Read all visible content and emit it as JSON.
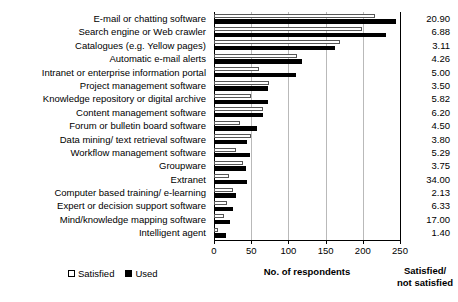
{
  "chart_data": {
    "type": "bar",
    "orientation": "horizontal",
    "title": "",
    "xlabel": "No. of respondents",
    "ylabel": "",
    "xlim": [
      0,
      250
    ],
    "xticks": [
      0,
      50,
      100,
      150,
      200,
      250
    ],
    "grid": true,
    "legend": [
      "Satisfied",
      "Used"
    ],
    "legend_position": "bottom-left",
    "categories": [
      "E-mail or chatting software",
      "Search engine or Web crawler",
      "Catalogues (e.g. Yellow pages)",
      "Automatic e-mail alerts",
      "Intranet or enterprise information portal",
      "Project management software",
      "Knowledge repository or digital archive",
      "Content management software",
      "Forum or bulletin board software",
      "Data mining/ text retrieval software",
      "Workflow management software",
      "Groupware",
      "Extranet",
      "Computer based training/ e-learning",
      "Expert or decision support software",
      "Mind/knowledge mapping software",
      "Intelligent agent"
    ],
    "series": [
      {
        "name": "Satisfied",
        "values": [
          216,
          199,
          170,
          112,
          60,
          74,
          50,
          66,
          35,
          50,
          30,
          39,
          20,
          25,
          18,
          13,
          5
        ]
      },
      {
        "name": "Used",
        "values": [
          245,
          231,
          162,
          118,
          110,
          72,
          72,
          66,
          58,
          45,
          48,
          43,
          44,
          30,
          25,
          21,
          16
        ]
      }
    ],
    "annotation_column": {
      "title": "Satisfied/\nnot satisfied",
      "title_line1": "Satisfied/",
      "title_line2": "not satisfied",
      "values": [
        "20.90",
        "6.88",
        "3.11",
        "4.26",
        "5.00",
        "3.50",
        "5.82",
        "6.20",
        "4.50",
        "3.80",
        "5.29",
        "3.75",
        "34.00",
        "2.13",
        "6.33",
        "17.00",
        "1.40"
      ]
    }
  },
  "colors": {
    "used_bar": "#000000",
    "satisfied_bar": "#ffffff",
    "satisfied_border": "#555555",
    "gridline": "#b9b9b9",
    "axis": "#000000",
    "background": "#ffffff"
  }
}
